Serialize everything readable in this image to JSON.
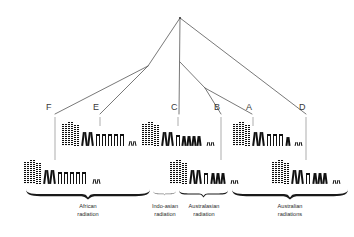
{
  "figure": {
    "type": "phylogenetic-karyotype-diagram",
    "background": "#ffffff",
    "line_color": "#555555",
    "chromosome_color": "#111111",
    "width": 354,
    "height": 237
  },
  "tree": {
    "apex": {
      "x": 180,
      "y": 18
    },
    "nodes": [
      {
        "id": "left-node",
        "x": 148,
        "y": 66
      },
      {
        "id": "right-node",
        "x": 205,
        "y": 88
      }
    ],
    "edges": [
      {
        "from": "apex",
        "to": "left-node"
      },
      {
        "from": "apex",
        "to": "center-C"
      },
      {
        "from": "apex",
        "to": "right-D"
      },
      {
        "from": "left-node",
        "to": "tip-F"
      },
      {
        "from": "left-node",
        "to": "tip-E"
      },
      {
        "from": "apex-stem",
        "to": "right-node"
      },
      {
        "from": "right-node",
        "to": "tip-B"
      },
      {
        "from": "right-node",
        "to": "tip-A"
      }
    ]
  },
  "tips": [
    {
      "id": "F",
      "label": "F",
      "label_x": 49,
      "label_y": 106,
      "stem_x": 55,
      "stem_top": 117,
      "stem_bottom": 160,
      "karyotype": "karyotype_F"
    },
    {
      "id": "E",
      "label": "E",
      "label_x": 96,
      "label_y": 106,
      "stem_x": 100,
      "stem_top": 117,
      "stem_bottom": 126,
      "karyotype": "karyotype_E"
    },
    {
      "id": "C",
      "label": "C",
      "label_x": 174,
      "label_y": 106,
      "stem_x": 178,
      "stem_top": 117,
      "stem_bottom": 126,
      "karyotype": "karyotype_C"
    },
    {
      "id": "B",
      "label": "B",
      "label_x": 217,
      "label_y": 106,
      "stem_x": 221,
      "stem_top": 117,
      "stem_bottom": 160,
      "karyotype": "karyotype_B"
    },
    {
      "id": "A",
      "label": "A",
      "label_x": 249,
      "label_y": 106,
      "stem_x": 253,
      "stem_top": 117,
      "stem_bottom": 126,
      "karyotype": "karyotype_A"
    },
    {
      "id": "D",
      "label": "D",
      "label_x": 302,
      "label_y": 106,
      "stem_x": 306,
      "stem_top": 117,
      "stem_bottom": 160,
      "karyotype": "karyotype_D"
    }
  ],
  "karyotypes": {
    "karyotype_E": {
      "row": "upper",
      "x": 62,
      "y": 120,
      "tip": "E",
      "chromosomes": [
        {
          "shape": "banded-long",
          "w": 5,
          "h": 22,
          "gap": 1
        },
        {
          "shape": "banded-long",
          "w": 5,
          "h": 24,
          "gap": 1
        },
        {
          "shape": "banded-long",
          "w": 5,
          "h": 21,
          "gap": 3
        },
        {
          "shape": "x-medium",
          "w": 5,
          "h": 14,
          "gap": 1
        },
        {
          "shape": "x-medium",
          "w": 5,
          "h": 14,
          "gap": 3
        },
        {
          "shape": "acro-short",
          "w": 4,
          "h": 12,
          "gap": 2
        },
        {
          "shape": "acro-short",
          "w": 4,
          "h": 12,
          "gap": 2
        },
        {
          "shape": "acro-short",
          "w": 4,
          "h": 12,
          "gap": 2
        },
        {
          "shape": "acro-short",
          "w": 4,
          "h": 12,
          "gap": 2
        },
        {
          "shape": "acro-short",
          "w": 4,
          "h": 12,
          "gap": 5
        },
        {
          "shape": "dot-tiny",
          "w": 3,
          "h": 5,
          "gap": 1
        },
        {
          "shape": "dot-tiny",
          "w": 3,
          "h": 5,
          "gap": 0
        }
      ]
    },
    "karyotype_F": {
      "row": "lower",
      "x": 24,
      "y": 158,
      "tip": "F",
      "chromosomes": [
        {
          "shape": "banded-long",
          "w": 5,
          "h": 22,
          "gap": 1
        },
        {
          "shape": "banded-long",
          "w": 5,
          "h": 24,
          "gap": 1
        },
        {
          "shape": "banded-long",
          "w": 5,
          "h": 21,
          "gap": 3
        },
        {
          "shape": "x-medium",
          "w": 5,
          "h": 14,
          "gap": 1
        },
        {
          "shape": "x-medium",
          "w": 5,
          "h": 14,
          "gap": 3
        },
        {
          "shape": "acro-short",
          "w": 4,
          "h": 12,
          "gap": 2
        },
        {
          "shape": "acro-short",
          "w": 4,
          "h": 12,
          "gap": 2
        },
        {
          "shape": "acro-short",
          "w": 4,
          "h": 12,
          "gap": 2
        },
        {
          "shape": "acro-short",
          "w": 4,
          "h": 12,
          "gap": 2
        },
        {
          "shape": "acro-short",
          "w": 4,
          "h": 12,
          "gap": 7
        },
        {
          "shape": "dot-tiny",
          "w": 3,
          "h": 5,
          "gap": 1
        },
        {
          "shape": "dot-tiny",
          "w": 3,
          "h": 5,
          "gap": 0
        }
      ]
    },
    "karyotype_C": {
      "row": "upper",
      "x": 142,
      "y": 120,
      "tip": "C",
      "chromosomes": [
        {
          "shape": "banded-long",
          "w": 5,
          "h": 22,
          "gap": 1
        },
        {
          "shape": "banded-long",
          "w": 5,
          "h": 24,
          "gap": 1
        },
        {
          "shape": "banded-long",
          "w": 5,
          "h": 21,
          "gap": 3
        },
        {
          "shape": "x-medium",
          "w": 5,
          "h": 14,
          "gap": 1
        },
        {
          "shape": "x-medium",
          "w": 5,
          "h": 14,
          "gap": 3
        },
        {
          "shape": "acro-short",
          "w": 4,
          "h": 11,
          "gap": 2
        },
        {
          "shape": "x-small",
          "w": 4,
          "h": 10,
          "gap": 1
        },
        {
          "shape": "x-small",
          "w": 4,
          "h": 10,
          "gap": 1
        },
        {
          "shape": "x-small",
          "w": 4,
          "h": 10,
          "gap": 1
        },
        {
          "shape": "x-small",
          "w": 4,
          "h": 10,
          "gap": 6
        },
        {
          "shape": "dot-tiny",
          "w": 3,
          "h": 4,
          "gap": 1
        },
        {
          "shape": "dot-tiny",
          "w": 3,
          "h": 4,
          "gap": 0
        }
      ]
    },
    "karyotype_B": {
      "row": "lower",
      "x": 170,
      "y": 158,
      "tip": "B",
      "chromosomes": [
        {
          "shape": "banded-long",
          "w": 5,
          "h": 22,
          "gap": 1
        },
        {
          "shape": "banded-long",
          "w": 5,
          "h": 24,
          "gap": 1
        },
        {
          "shape": "banded-long",
          "w": 5,
          "h": 21,
          "gap": 3
        },
        {
          "shape": "x-medium",
          "w": 5,
          "h": 14,
          "gap": 1
        },
        {
          "shape": "x-medium",
          "w": 5,
          "h": 14,
          "gap": 3
        },
        {
          "shape": "acro-short",
          "w": 4,
          "h": 11,
          "gap": 3
        },
        {
          "shape": "x-small",
          "w": 4,
          "h": 11,
          "gap": 1
        },
        {
          "shape": "x-small",
          "w": 4,
          "h": 11,
          "gap": 1
        },
        {
          "shape": "x-small",
          "w": 4,
          "h": 11,
          "gap": 6
        },
        {
          "shape": "dot-tiny",
          "w": 3,
          "h": 4,
          "gap": 1
        },
        {
          "shape": "dot-tiny",
          "w": 3,
          "h": 4,
          "gap": 0
        }
      ]
    },
    "karyotype_A": {
      "row": "upper",
      "x": 233,
      "y": 120,
      "tip": "A",
      "chromosomes": [
        {
          "shape": "banded-long",
          "w": 5,
          "h": 22,
          "gap": 1
        },
        {
          "shape": "banded-long",
          "w": 5,
          "h": 24,
          "gap": 1
        },
        {
          "shape": "banded-long",
          "w": 5,
          "h": 21,
          "gap": 3
        },
        {
          "shape": "x-medium",
          "w": 5,
          "h": 14,
          "gap": 1
        },
        {
          "shape": "x-medium",
          "w": 5,
          "h": 14,
          "gap": 3
        },
        {
          "shape": "acro-short",
          "w": 4,
          "h": 12,
          "gap": 2
        },
        {
          "shape": "acro-short",
          "w": 4,
          "h": 12,
          "gap": 2
        },
        {
          "shape": "acro-short",
          "w": 4,
          "h": 12,
          "gap": 3
        },
        {
          "shape": "x-small",
          "w": 4,
          "h": 9,
          "gap": 5
        },
        {
          "shape": "dot-tiny",
          "w": 3,
          "h": 4,
          "gap": 1
        },
        {
          "shape": "dot-tiny",
          "w": 3,
          "h": 4,
          "gap": 0
        }
      ]
    },
    "karyotype_D": {
      "row": "lower",
      "x": 272,
      "y": 158,
      "tip": "D",
      "chromosomes": [
        {
          "shape": "banded-long",
          "w": 5,
          "h": 22,
          "gap": 1
        },
        {
          "shape": "banded-long",
          "w": 5,
          "h": 24,
          "gap": 1
        },
        {
          "shape": "banded-long",
          "w": 5,
          "h": 21,
          "gap": 3
        },
        {
          "shape": "x-medium",
          "w": 5,
          "h": 14,
          "gap": 1
        },
        {
          "shape": "x-medium",
          "w": 5,
          "h": 14,
          "gap": 3
        },
        {
          "shape": "acro-short",
          "w": 4,
          "h": 11,
          "gap": 3
        },
        {
          "shape": "x-small",
          "w": 4,
          "h": 11,
          "gap": 1
        },
        {
          "shape": "x-small",
          "w": 4,
          "h": 11,
          "gap": 1
        },
        {
          "shape": "x-small",
          "w": 4,
          "h": 11,
          "gap": 6
        },
        {
          "shape": "dot-tiny",
          "w": 3,
          "h": 4,
          "gap": 1
        },
        {
          "shape": "dot-tiny",
          "w": 3,
          "h": 4,
          "gap": 0
        }
      ]
    }
  },
  "groups": [
    {
      "id": "african",
      "label_line1": "African",
      "label_line2": "radiation",
      "brace_left": 26,
      "brace_right": 150,
      "brace_y": 190,
      "brace_weight": "heavy",
      "label_x": 26,
      "label_width": 124,
      "label_y": 202
    },
    {
      "id": "indo-asian",
      "label_line1": "Indo-asian",
      "label_line2": "radiation",
      "brace_left": 153,
      "brace_right": 176,
      "brace_y": 190,
      "brace_weight": "light",
      "label_x": 143,
      "label_width": 44,
      "label_y": 202
    },
    {
      "id": "australasian",
      "label_line1": "Australasian",
      "label_line2": "radiation",
      "brace_left": 179,
      "brace_right": 228,
      "brace_y": 190,
      "brace_weight": "medium",
      "label_x": 177,
      "label_width": 54,
      "label_y": 202
    },
    {
      "id": "australian",
      "label_line1": "Australian",
      "label_line2": "radiations",
      "brace_left": 232,
      "brace_right": 348,
      "brace_y": 190,
      "brace_weight": "heavy",
      "label_x": 232,
      "label_width": 116,
      "label_y": 202
    }
  ]
}
